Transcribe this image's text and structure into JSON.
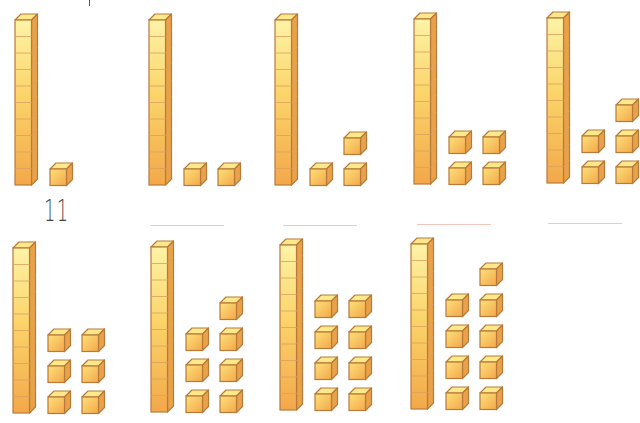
{
  "worksheet": {
    "title": "",
    "colors": {
      "cube_top": "#fde98a",
      "cube_front_light": "#fbd46a",
      "cube_front_dark": "#f3a84a",
      "cube_side": "#e9a24a",
      "cube_edge": "#b87a3a",
      "answer_line": "#f2c7bd"
    },
    "groups": [
      {
        "id": 1,
        "tens": 1,
        "ones": 1,
        "value": 11,
        "answer": "11",
        "row": 0,
        "rod_x": 14,
        "rod_y": 13
      },
      {
        "id": 2,
        "tens": 1,
        "ones": 2,
        "value": 12,
        "answer": "",
        "row": 0,
        "rod_x": 148,
        "rod_y": 13
      },
      {
        "id": 3,
        "tens": 1,
        "ones": 3,
        "value": 13,
        "answer": "",
        "row": 0,
        "rod_x": 274,
        "rod_y": 13
      },
      {
        "id": 4,
        "tens": 1,
        "ones": 4,
        "value": 14,
        "answer": "",
        "row": 0,
        "rod_x": 413,
        "rod_y": 12
      },
      {
        "id": 5,
        "tens": 1,
        "ones": 5,
        "value": 15,
        "answer": "",
        "row": 0,
        "rod_x": 546,
        "rod_y": 11
      },
      {
        "id": 6,
        "tens": 1,
        "ones": 6,
        "value": 16,
        "answer": "",
        "row": 1,
        "rod_x": 12,
        "rod_y": 241
      },
      {
        "id": 7,
        "tens": 1,
        "ones": 7,
        "value": 17,
        "answer": "",
        "row": 1,
        "rod_x": 150,
        "rod_y": 240
      },
      {
        "id": 8,
        "tens": 1,
        "ones": 8,
        "value": 18,
        "answer": "",
        "row": 1,
        "rod_x": 279,
        "rod_y": 238
      },
      {
        "id": 9,
        "tens": 1,
        "ones": 9,
        "value": 19,
        "answer": "",
        "row": 1,
        "rod_x": 410,
        "rod_y": 237
      }
    ],
    "answer_lines": [
      {
        "group": 2,
        "x": 150,
        "y": 225,
        "width": 74
      },
      {
        "group": 3,
        "x": 283,
        "y": 225,
        "width": 74
      },
      {
        "group": 4,
        "x": 417,
        "y": 224,
        "width": 74
      },
      {
        "group": 5,
        "x": 548,
        "y": 223,
        "width": 74
      }
    ],
    "filled_answer": {
      "text": "11",
      "x": 44,
      "y": 193
    }
  }
}
